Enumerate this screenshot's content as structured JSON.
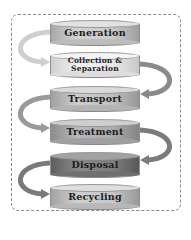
{
  "diagram": {
    "type": "flow",
    "steps": [
      {
        "label": "Generation",
        "fill": "#c9c9c9",
        "top": "#d8d8d8"
      },
      {
        "label": "Collection & Separation",
        "line1": "Collection &",
        "line2": "Separation",
        "fill": "#e6e6e6",
        "top": "#efefef"
      },
      {
        "label": "Transport",
        "fill": "#bdbdbd",
        "top": "#d2d2d2"
      },
      {
        "label": "Treatment",
        "fill": "#a9a9a9",
        "top": "#c6c6c6"
      },
      {
        "label": "Disposal",
        "fill": "#7d7d7d",
        "top": "#9c9c9c"
      },
      {
        "label": "Recycling",
        "fill": "#c4c4c4",
        "top": "#d6d6d6"
      }
    ],
    "arrow_color": "#8c8c8c",
    "border_style": "dashed"
  }
}
